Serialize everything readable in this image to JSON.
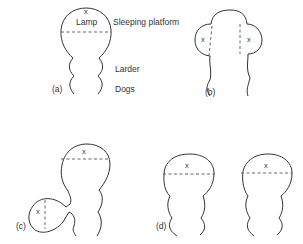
{
  "diagram": {
    "panels": [
      {
        "id": "a",
        "label": "(a)",
        "annotations": {
          "x_mark": "x",
          "lamp": "Lamp",
          "sleeping_platform": "Sleeping platform",
          "larder": "Larder",
          "dogs": "Dogs"
        }
      },
      {
        "id": "b",
        "label": "(b)",
        "x_marks": [
          "x",
          "x"
        ]
      },
      {
        "id": "c",
        "label": "(c)",
        "x_marks": [
          "x",
          "x"
        ]
      },
      {
        "id": "d",
        "label": "(d)",
        "x_marks": [
          "x",
          "x"
        ]
      }
    ]
  }
}
